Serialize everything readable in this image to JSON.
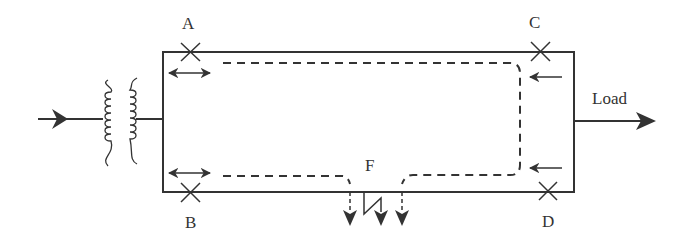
{
  "diagram": {
    "labels": {
      "breaker_a": "A",
      "breaker_b": "B",
      "breaker_c": "C",
      "breaker_d": "D",
      "fault": "F",
      "load": "Load"
    },
    "colors": {
      "line": "#333333",
      "background": "#ffffff"
    },
    "elements": [
      {
        "type": "source-input-arrow",
        "direction": "right"
      },
      {
        "type": "transformer"
      },
      {
        "type": "ring-feeder"
      },
      {
        "type": "circuit-breaker",
        "label": "A",
        "relay": "bidirectional"
      },
      {
        "type": "circuit-breaker",
        "label": "B",
        "relay": "bidirectional"
      },
      {
        "type": "circuit-breaker",
        "label": "C",
        "relay": "directional-left"
      },
      {
        "type": "circuit-breaker",
        "label": "D",
        "relay": "directional-left"
      },
      {
        "type": "fault",
        "label": "F",
        "symbol": "lightning-to-ground"
      },
      {
        "type": "load-output-arrow",
        "label": "Load",
        "direction": "right"
      },
      {
        "type": "fault-current-path",
        "style": "dashed"
      }
    ]
  }
}
